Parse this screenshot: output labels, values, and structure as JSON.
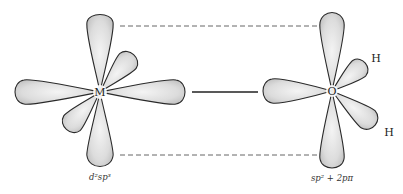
{
  "figure": {
    "metal": {
      "symbol": "M",
      "hybridization_label": "d²sp³"
    },
    "oxygen": {
      "symbol": "O",
      "hybridization_label": "sp² + 2pπ",
      "substituents": [
        "H",
        "H"
      ]
    },
    "bonds": {
      "sigma": "solid line between M and O lobes",
      "pi": [
        "dashed line between upper lobes",
        "dashed line between lower lobes"
      ]
    }
  }
}
